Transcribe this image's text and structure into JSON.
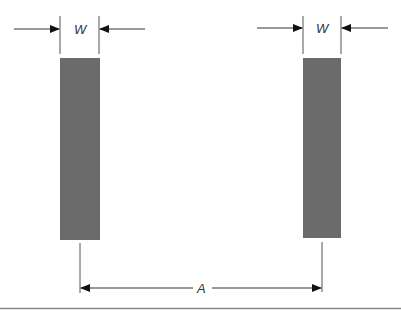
{
  "diagram": {
    "labels": {
      "width_left": "W",
      "width_right": "W",
      "spacing": "A"
    },
    "colors": {
      "bar_fill": "#6b6b6b",
      "line": "#555555",
      "arrow": "#111111",
      "divider": "#888888"
    },
    "elements": {
      "left_bar": {
        "x": 60,
        "y": 58,
        "w": 40,
        "h": 182
      },
      "right_bar": {
        "x": 303,
        "y": 58,
        "w": 38,
        "h": 180
      }
    }
  }
}
